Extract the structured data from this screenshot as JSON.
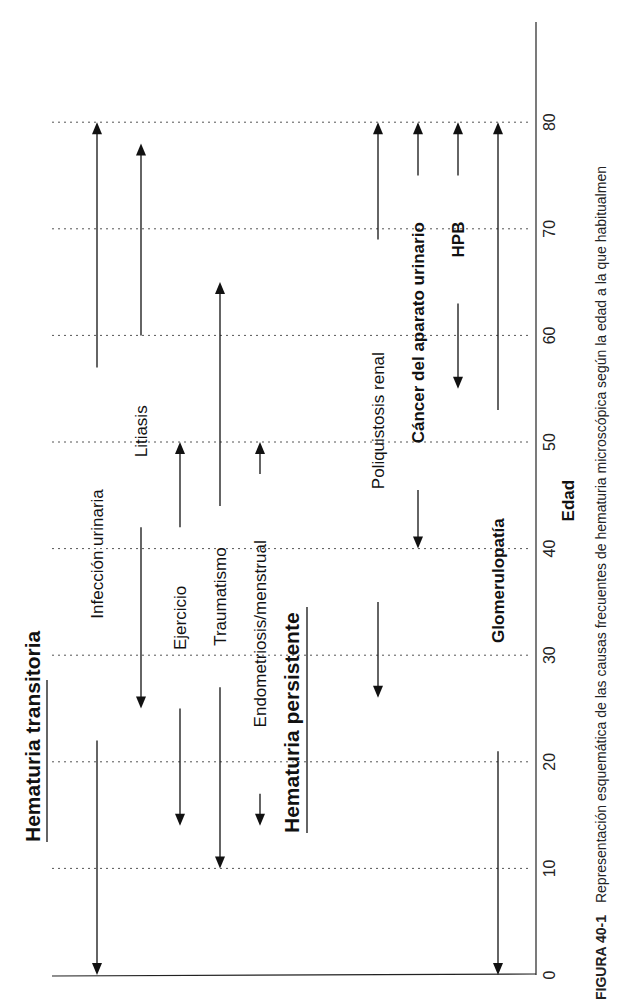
{
  "chart_data": {
    "type": "range-arrow-diagram",
    "orientation": "rotated-90-ccw",
    "xlabel": "Edad",
    "xlim": [
      0,
      85
    ],
    "ticks": [
      0,
      10,
      20,
      30,
      40,
      50,
      60,
      70,
      80
    ],
    "grid": true,
    "groups": [
      {
        "title": "Hematuria transitoria",
        "items": [
          {
            "label": "Infección urinaria",
            "bold": false,
            "start": 0,
            "end": 80,
            "label_from": 22,
            "label_to": 57
          },
          {
            "label": "Litiasis",
            "bold": false,
            "start": 25,
            "end": 78,
            "label_from": 42,
            "label_to": 60
          },
          {
            "label": "Ejercicio",
            "bold": false,
            "start": 14,
            "end": 50,
            "label_from": 25,
            "label_to": 42
          },
          {
            "label": "Traumatismo",
            "bold": false,
            "start": 10,
            "end": 65,
            "label_from": 27,
            "label_to": 44
          },
          {
            "label": "Endometriosis/menstrual",
            "bold": false,
            "start": 14,
            "end": 50,
            "label_from": 17,
            "label_to": 47
          }
        ]
      },
      {
        "title": "Hematuria persistente",
        "items": [
          {
            "label": "Poliquistosis renal",
            "bold": false,
            "start": 26,
            "end": 80,
            "label_from": 35,
            "label_to": 69
          },
          {
            "label": "Cáncer del aparato urinario",
            "bold": true,
            "start": 40,
            "end": 80,
            "label_from": 45.5,
            "label_to": 75
          },
          {
            "label": "HPB",
            "bold": true,
            "start": 55,
            "end": 80,
            "label_from": 63,
            "label_to": 75
          },
          {
            "label": "Glomerulopatía",
            "bold": true,
            "start": 0,
            "end": 80,
            "label_from": 21,
            "label_to": 53
          }
        ]
      }
    ]
  },
  "caption": {
    "figure_label": "FIGURA 40-1",
    "text": "Representación esquemática de las causas frecuentes de hematuria microscópica según la edad a la que habitualmen"
  }
}
